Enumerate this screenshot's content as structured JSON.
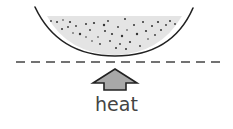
{
  "diagram": {
    "label": "heat",
    "colors": {
      "bowl_stroke": "#222222",
      "liquid_fill": "#e4e4e4",
      "particles": "#333333",
      "dashed_line": "#444444",
      "arrow_fill": "#a8a8a8",
      "arrow_stroke": "#222222",
      "label": "#444444"
    },
    "elements": {
      "bowl": "curved-dish",
      "contents": "liquid-with-particles",
      "surface": "dashed-line",
      "arrow": "up-arrow"
    }
  }
}
